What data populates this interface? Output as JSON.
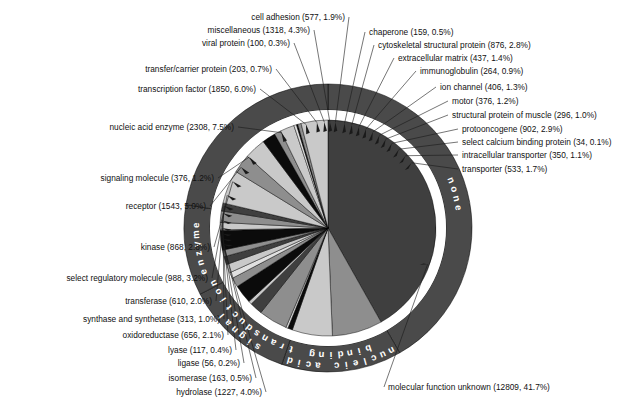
{
  "chart_data": {
    "type": "pie",
    "title": "",
    "subtitle": "",
    "xlabel": "",
    "ylabel": "",
    "legend_position": "none",
    "grid": false,
    "total_count": 30711,
    "value_format": "name (count, percent)",
    "categories": [
      "molecular function unknown",
      "nucleic acid enzyme",
      "transcription factor",
      "transfer/carrier protein",
      "viral protein",
      "miscellaneous",
      "cell adhesion",
      "chaperone",
      "cytoskeletal structural protein",
      "extracellular matrix",
      "immunoglobulin",
      "ion channel",
      "motor",
      "structural protein of muscle",
      "protooncogene",
      "select calcium binding protein",
      "intracellular transporter",
      "transporter",
      "signaling molecule",
      "receptor",
      "kinase",
      "select regulatory molecule",
      "transferase",
      "synthase and synthetase",
      "oxidoreductase",
      "lyase",
      "ligase",
      "isomerase",
      "hydrolase"
    ],
    "values": [
      12809,
      2308,
      1850,
      203,
      100,
      1318,
      577,
      159,
      876,
      437,
      264,
      406,
      376,
      296,
      902,
      34,
      350,
      533,
      376,
      1543,
      868,
      988,
      610,
      313,
      656,
      117,
      56,
      163,
      1227
    ],
    "percents": [
      41.7,
      7.5,
      6.0,
      0.7,
      0.3,
      4.3,
      1.9,
      0.5,
      2.8,
      1.4,
      0.9,
      1.3,
      1.2,
      1.0,
      2.9,
      0.1,
      1.1,
      1.7,
      1.2,
      5.0,
      2.8,
      3.2,
      2.0,
      1.0,
      2.1,
      0.4,
      0.2,
      0.5,
      4.0
    ],
    "groups": [
      {
        "name": "none",
        "percent": 41.7
      },
      {
        "name": "nucleic acid binding",
        "percent": 13.5
      },
      {
        "name": "signal transduction",
        "percent": 12.2
      },
      {
        "name": "enzyme",
        "percent": 10.2
      }
    ]
  },
  "ring_labels": [
    {
      "id": "none",
      "text": "none"
    },
    {
      "id": "nucleic-acid-binding",
      "text": "nucleic acid binding"
    },
    {
      "id": "signal-transduction",
      "text": "signal transduction"
    },
    {
      "id": "enzyme",
      "text": "enzyme"
    }
  ],
  "labels": [
    {
      "id": "cell-adhesion",
      "text": "cell adhesion (577, 1.9%)"
    },
    {
      "id": "miscellaneous",
      "text": "miscellaneous (1318, 4.3%)"
    },
    {
      "id": "viral-protein",
      "text": "viral protein (100, 0.3%)"
    },
    {
      "id": "transfer-carrier-protein",
      "text": "transfer/carrier protein (203, 0.7%)"
    },
    {
      "id": "transcription-factor",
      "text": "transcription factor (1850, 6.0%)"
    },
    {
      "id": "nucleic-acid-enzyme",
      "text": "nucleic acid enzyme (2308, 7.5%)"
    },
    {
      "id": "signaling-molecule",
      "text": "signaling molecule (376, 1.2%)"
    },
    {
      "id": "receptor",
      "text": "receptor (1543, 5.0%)"
    },
    {
      "id": "kinase",
      "text": "kinase (868, 2.8%)"
    },
    {
      "id": "select-regulatory-molecule",
      "text": "select regulatory molecule (988, 3.2%)"
    },
    {
      "id": "transferase",
      "text": "transferase (610, 2.0%)"
    },
    {
      "id": "synthase-and-synthetase",
      "text": "synthase and synthetase (313, 1.0%)"
    },
    {
      "id": "oxidoreductase",
      "text": "oxidoreductase (656, 2.1%)"
    },
    {
      "id": "lyase",
      "text": "lyase (117, 0.4%)"
    },
    {
      "id": "ligase",
      "text": "ligase (56, 0.2%)"
    },
    {
      "id": "isomerase",
      "text": "isomerase (163, 0.5%)"
    },
    {
      "id": "hydrolase",
      "text": "hydrolase (1227, 4.0%)"
    },
    {
      "id": "chaperone",
      "text": "chaperone (159, 0.5%)"
    },
    {
      "id": "cytoskeletal-structural-protein",
      "text": "cytoskeletal structural protein (876, 2.8%)"
    },
    {
      "id": "extracellular-matrix",
      "text": "extracellular matrix (437, 1.4%)"
    },
    {
      "id": "immunoglobulin",
      "text": "immunoglobulin (264, 0.9%)"
    },
    {
      "id": "ion-channel",
      "text": "ion channel (406, 1.3%)"
    },
    {
      "id": "motor",
      "text": "motor (376, 1.2%)"
    },
    {
      "id": "structural-protein-of-muscle",
      "text": "structural protein of muscle (296, 1.0%)"
    },
    {
      "id": "protooncogene",
      "text": "protooncogene (902, 2.9%)"
    },
    {
      "id": "select-calcium-binding-protein",
      "text": "select calcium binding protein (34, 0.1%)"
    },
    {
      "id": "intracellular-transporter",
      "text": "intracellular transporter (350, 1.1%)"
    },
    {
      "id": "transporter",
      "text": "transporter (533, 1.7%)"
    },
    {
      "id": "molecular-function-unknown",
      "text": "molecular function unknown (12809, 41.7%)"
    }
  ],
  "colors": {
    "background": "#ffffff",
    "ring_fill": "#4a4a4a",
    "ring_text": "#ffffff",
    "gap": "#ffffff",
    "outline": "#000000",
    "label_text": "#101010",
    "dark": "#3f3f3f",
    "mid": "#8e8e8e",
    "light": "#c9c9c9",
    "black": "#0b0b0b",
    "pale": "#e0e0e0"
  }
}
